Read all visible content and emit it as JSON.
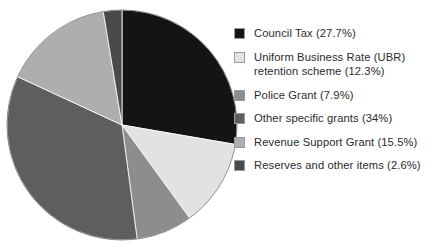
{
  "chart_data": {
    "type": "pie",
    "title": "",
    "subtitle": "",
    "xlabel": "",
    "ylabel": "",
    "legend_position": "right",
    "grid": false,
    "start_angle_deg": 0,
    "direction": "clockwise",
    "categories": [
      "Council Tax",
      "Uniform Business Rate (UBR) retention scheme",
      "Police Grant",
      "Other specific grants",
      "Revenue Support Grant",
      "Reserves and other items"
    ],
    "values": [
      27.7,
      12.3,
      7.9,
      34.0,
      15.5,
      2.6
    ],
    "units": "percent",
    "colors": [
      "#141414",
      "#e2e2e2",
      "#8d8d8d",
      "#5e5e5e",
      "#aeaeae",
      "#4a4a4a"
    ],
    "slices": [
      {
        "label": "Council Tax",
        "value": 27.7,
        "legend_text": "Council Tax (27.7%)",
        "color": "#141414",
        "start_deg": 0.0,
        "end_deg": 99.72
      },
      {
        "label": "Uniform Business Rate (UBR) retention scheme",
        "value": 12.3,
        "legend_text": "Uniform Business Rate (UBR)\nretention scheme (12.3%)",
        "color": "#e2e2e2",
        "start_deg": 99.72,
        "end_deg": 144.0
      },
      {
        "label": "Police Grant",
        "value": 7.9,
        "legend_text": "Police Grant (7.9%)",
        "color": "#8d8d8d",
        "start_deg": 144.0,
        "end_deg": 172.44
      },
      {
        "label": "Other specific grants",
        "value": 34.0,
        "legend_text": "Other specific grants (34%)",
        "color": "#5e5e5e",
        "start_deg": 172.44,
        "end_deg": 294.84
      },
      {
        "label": "Revenue Support Grant",
        "value": 15.5,
        "legend_text": "Revenue Support Grant (15.5%)",
        "color": "#aeaeae",
        "start_deg": 294.84,
        "end_deg": 350.64
      },
      {
        "label": "Reserves and other items",
        "value": 2.6,
        "legend_text": "Reserves and other items (2.6%)",
        "color": "#4a4a4a",
        "start_deg": 350.64,
        "end_deg": 360.0
      }
    ]
  },
  "legend": {
    "items": [
      {
        "label": "Council Tax (27.7%)",
        "color": "#141414"
      },
      {
        "label": "Uniform Business Rate (UBR)\nretention scheme (12.3%)",
        "color": "#e2e2e2"
      },
      {
        "label": "Police Grant (7.9%)",
        "color": "#8d8d8d"
      },
      {
        "label": "Other specific grants (34%)",
        "color": "#5e5e5e"
      },
      {
        "label": "Revenue Support Grant (15.5%)",
        "color": "#aeaeae"
      },
      {
        "label": "Reserves and other items (2.6%)",
        "color": "#4a4a4a"
      }
    ]
  }
}
